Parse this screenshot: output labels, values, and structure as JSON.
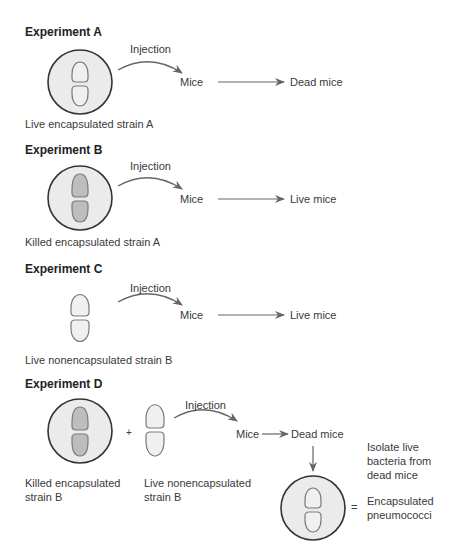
{
  "colors": {
    "dish_fill": "#ebebeb",
    "dish_stroke": "#333333",
    "live_cell_fill": "#f0f0f0",
    "killed_cell_fill": "#bdbdbd",
    "cell_stroke": "#7a7a7a",
    "arrow": "#666666"
  },
  "experiments": [
    {
      "title": "Experiment A",
      "injection_label": "Injection",
      "mice_label": "Mice",
      "outcome_label": "Dead mice",
      "sample_label": "Live encapsulated strain A"
    },
    {
      "title": "Experiment B",
      "injection_label": "Injection",
      "mice_label": "Mice",
      "outcome_label": "Live mice",
      "sample_label": "Killed encapsulated strain A"
    },
    {
      "title": "Experiment C",
      "injection_label": "Injection",
      "mice_label": "Mice",
      "outcome_label": "Live mice",
      "sample_label": "Live nonencapsulated strain B"
    },
    {
      "title": "Experiment D",
      "injection_label": "Injection",
      "mice_label": "Mice",
      "outcome_label": "Dead mice",
      "plus_sign": "+",
      "sample_label_1_line1": "Killed encapsulated",
      "sample_label_1_line2": "strain B",
      "sample_label_2_line1": "Live nonencapsulated",
      "sample_label_2_line2": "strain B",
      "isolate_line1": "Isolate live",
      "isolate_line2": "bacteria from",
      "isolate_line3": "dead mice",
      "equals_sign": "=",
      "result_line1": "Encapsulated",
      "result_line2": "pneumococci"
    }
  ]
}
